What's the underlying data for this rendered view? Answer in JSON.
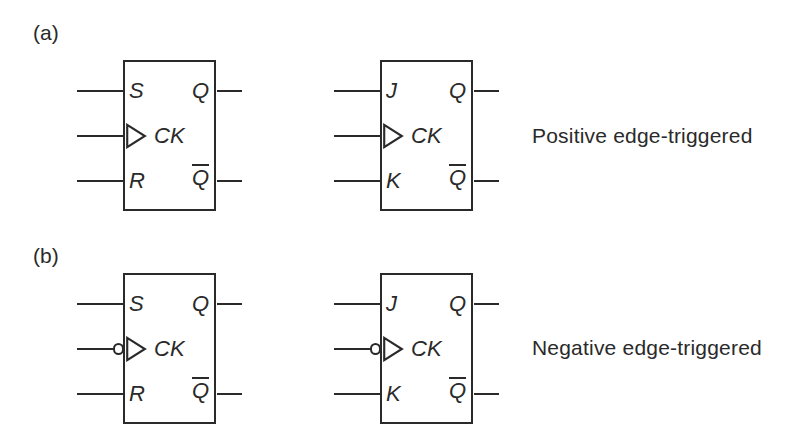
{
  "figure": {
    "part_a_label": "(a)",
    "part_b_label": "(b)"
  },
  "captions": {
    "positive": "Positive edge-triggered",
    "negative": "Negative edge-triggered"
  },
  "colors": {
    "ink": "#2a2a2a",
    "background": "#ffffff"
  },
  "flipflops": [
    {
      "type": "SR flip-flop",
      "edge": "positive",
      "clock_bubble": false,
      "inputs": {
        "top": "S",
        "clock": "CK",
        "bottom": "R"
      },
      "outputs": {
        "top": "Q",
        "bottom": "Q",
        "bottom_overline": true
      }
    },
    {
      "type": "JK flip-flop",
      "edge": "positive",
      "clock_bubble": false,
      "inputs": {
        "top": "J",
        "clock": "CK",
        "bottom": "K"
      },
      "outputs": {
        "top": "Q",
        "bottom": "Q",
        "bottom_overline": true
      }
    },
    {
      "type": "SR flip-flop",
      "edge": "negative",
      "clock_bubble": true,
      "inputs": {
        "top": "S",
        "clock": "CK",
        "bottom": "R"
      },
      "outputs": {
        "top": "Q",
        "bottom": "Q",
        "bottom_overline": true
      }
    },
    {
      "type": "JK flip-flop",
      "edge": "negative",
      "clock_bubble": true,
      "inputs": {
        "top": "J",
        "clock": "CK",
        "bottom": "K"
      },
      "outputs": {
        "top": "Q",
        "bottom": "Q",
        "bottom_overline": true
      }
    }
  ]
}
